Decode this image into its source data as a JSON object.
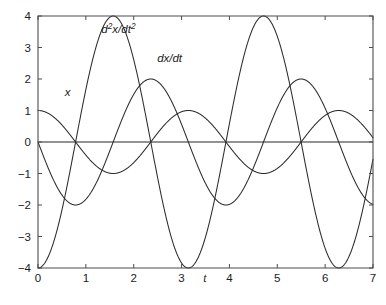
{
  "chart_data": {
    "type": "line",
    "title": "",
    "subtitle": "",
    "xlabel": "t",
    "ylabel": "",
    "xlim": [
      0,
      7
    ],
    "ylim": [
      -4,
      4
    ],
    "xticks": [
      0,
      1,
      2,
      3,
      4,
      5,
      6,
      7
    ],
    "xticklabels": [
      "0",
      "1",
      "2",
      "3",
      "4",
      "5",
      "6",
      "7"
    ],
    "yticks": [
      4,
      3,
      2,
      1,
      0,
      -1,
      -2,
      -3,
      -4
    ],
    "yticklabels": [
      "4",
      "3",
      "2",
      "1",
      "0",
      "-1",
      "-2",
      "-3",
      "-4"
    ],
    "grid": false,
    "legend_position": "inline-annotations",
    "zero_line": true,
    "line_color": "#2b2b2b",
    "axis_color": "#4d4d4d",
    "zero_line_color": "#6e6e6e",
    "background_color": "#ffffff",
    "series": [
      {
        "name": "x",
        "formula": "cos(2*t)",
        "amplitude": 1,
        "angular_frequency": 2,
        "phase": 0,
        "label": "x",
        "label_t": 0.62,
        "label_y": 1.45,
        "key_points": [
          {
            "t": 0,
            "y": 1
          },
          {
            "t": 0.785,
            "y": 0
          },
          {
            "t": 1.571,
            "y": -1
          },
          {
            "t": 2.356,
            "y": 0
          },
          {
            "t": 3.142,
            "y": 1
          },
          {
            "t": 3.927,
            "y": 0
          },
          {
            "t": 4.712,
            "y": -1
          },
          {
            "t": 5.498,
            "y": 0
          },
          {
            "t": 6.283,
            "y": 1
          },
          {
            "t": 7,
            "y": 0.137
          }
        ]
      },
      {
        "name": "dx/dt",
        "formula": "-2*sin(2*t)",
        "amplitude": 2,
        "angular_frequency": 2,
        "phase": 0,
        "label": "dx/dt",
        "label_t": 2.75,
        "label_y": 2.55,
        "key_points": [
          {
            "t": 0,
            "y": 0
          },
          {
            "t": 0.785,
            "y": -2
          },
          {
            "t": 1.571,
            "y": 0
          },
          {
            "t": 2.356,
            "y": 2
          },
          {
            "t": 3.142,
            "y": 0
          },
          {
            "t": 3.927,
            "y": -2
          },
          {
            "t": 4.712,
            "y": 0
          },
          {
            "t": 5.498,
            "y": 2
          },
          {
            "t": 6.283,
            "y": 0
          },
          {
            "t": 7,
            "y": 1.983
          }
        ]
      },
      {
        "name": "d2x/dt2",
        "formula": "-4*cos(2*t)",
        "amplitude": 4,
        "angular_frequency": 2,
        "phase": 0,
        "label_parts": {
          "d": "d",
          "sup1": "2",
          "mid": "x/dt",
          "sup2": "2"
        },
        "label_t": 1.68,
        "label_y": 3.45,
        "key_points": [
          {
            "t": 0,
            "y": -4
          },
          {
            "t": 0.785,
            "y": 0
          },
          {
            "t": 1.571,
            "y": 4
          },
          {
            "t": 2.356,
            "y": 0
          },
          {
            "t": 3.142,
            "y": -4
          },
          {
            "t": 3.927,
            "y": 0
          },
          {
            "t": 4.712,
            "y": 4
          },
          {
            "t": 5.498,
            "y": 0
          },
          {
            "t": 6.283,
            "y": -4
          },
          {
            "t": 7,
            "y": -0.548
          }
        ]
      }
    ]
  }
}
